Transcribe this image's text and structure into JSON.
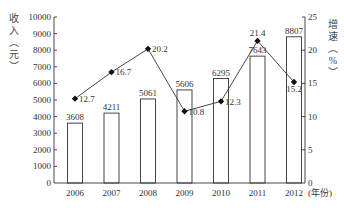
{
  "chart_data": {
    "type": "bar+line",
    "title": "",
    "categories": [
      "2006",
      "2007",
      "2008",
      "2009",
      "2010",
      "2011",
      "2012"
    ],
    "xlabel": "(年份)",
    "series": [
      {
        "name": "收入",
        "type": "bar",
        "axis": "left",
        "values": [
          3608,
          4211,
          5061,
          5606,
          6295,
          7643,
          8807
        ],
        "labels": [
          "3608",
          "4211",
          "5061",
          "5606",
          "6295",
          "7643",
          "8807"
        ]
      },
      {
        "name": "增速",
        "type": "line",
        "axis": "right",
        "marker": "diamond",
        "values": [
          12.7,
          16.7,
          20.2,
          10.8,
          12.3,
          21.4,
          15.2
        ],
        "labels": [
          "12.7",
          "16.7",
          "20.2",
          "10.8",
          "12.3",
          "21.4",
          "15.2"
        ]
      }
    ],
    "y_left": {
      "label": "收入（元）",
      "range": [
        0,
        10000
      ],
      "ticks": [
        0,
        1000,
        2000,
        3000,
        4000,
        5000,
        6000,
        7000,
        8000,
        9000,
        10000
      ]
    },
    "y_right": {
      "label": "增速（%）",
      "range": [
        0,
        25
      ],
      "ticks": [
        0,
        5,
        10,
        15,
        20,
        25
      ]
    },
    "grid": false,
    "legend": "none"
  },
  "colors": {
    "axis": "#333333",
    "bar_fill": "#ffffff",
    "bar_stroke": "#333333",
    "line": "#333333",
    "marker": "#111111"
  }
}
